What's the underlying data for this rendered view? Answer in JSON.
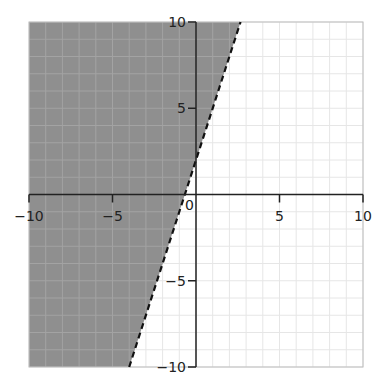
{
  "chart_data": {
    "type": "inequality-region",
    "title": "",
    "xlabel": "",
    "ylabel": "",
    "xlim": [
      -10,
      10
    ],
    "ylim": [
      -10,
      10
    ],
    "grid": true,
    "grid_step": 1,
    "x_ticks": [
      -10,
      -5,
      0,
      5,
      10
    ],
    "y_ticks": [
      -10,
      -5,
      5,
      10
    ],
    "x_tick_labels": [
      "−10",
      "−5",
      "0",
      "5",
      "10"
    ],
    "y_tick_labels": [
      "−10",
      "−5",
      "5",
      "10"
    ],
    "boundary_line": {
      "equation": "y = 3x + 2",
      "slope": 3,
      "intercept": 2,
      "style": "dashed",
      "points": [
        [
          -4,
          -10
        ],
        [
          2.667,
          10
        ]
      ]
    },
    "shaded_region": "y > 3x + 2",
    "inequality": "y > 3x + 2",
    "colors": {
      "shade": "#8f8f8f",
      "grid": "#e6e6e6",
      "grid_on_shade": "#a3a3a3",
      "axis": "#222222",
      "border": "#bdbdbd",
      "line": "#111111"
    }
  }
}
